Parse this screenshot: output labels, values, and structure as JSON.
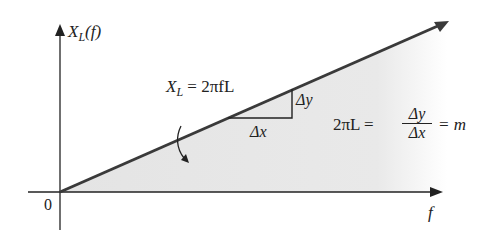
{
  "diagram": {
    "y_axis_label": "X",
    "y_axis_sub": "L",
    "y_axis_arg": "(f)",
    "x_axis_label": "f",
    "origin_label": "0",
    "line_eq_lhs": "X",
    "line_eq_sub": "L",
    "line_eq_rhs": "= 2πfL",
    "delta_x": "Δx",
    "delta_y": "Δy",
    "slope_lhs": "2πL =",
    "slope_num": "Δy",
    "slope_den": "Δx",
    "slope_rhs": "= m",
    "colors": {
      "line": "#3a3a3a",
      "fill": "#e6e6e6",
      "axis": "#222222"
    }
  }
}
